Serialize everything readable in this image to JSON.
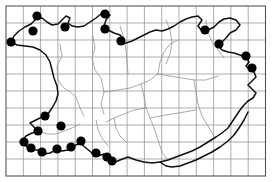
{
  "figure": {
    "kind": "species-distribution-map",
    "region_label": "England and Wales",
    "caption": "",
    "title": "",
    "background_color": "#ffffff",
    "outline_color": "#101010",
    "county_color": "#8d8d8d",
    "grid_color": "#8a8a8a",
    "dot_color": "#000000",
    "dot_radius": 4.6
  },
  "grid": {
    "visible": true,
    "columns": 15,
    "rows": 10,
    "cell_width": 17.3,
    "cell_height": 17.0,
    "x_start": 6,
    "y_start": 6,
    "x_end": 265.5,
    "y_end": 176
  },
  "legend": {
    "visible": false,
    "entries": [
      {
        "symbol": "filled-circle",
        "label": ""
      }
    ]
  },
  "axes": {
    "x_tick_labels": [],
    "y_tick_labels": [],
    "xlabel": "",
    "ylabel": ""
  },
  "chart_data": {
    "type": "scatter",
    "title": "",
    "xlabel": "",
    "ylabel": "",
    "grid": true,
    "legend_position": "none",
    "xlim": [
      6,
      265.5
    ],
    "ylim": [
      6,
      176
    ],
    "categories": [],
    "series": [
      {
        "name": "Records",
        "marker": "filled-circle",
        "color": "#000000",
        "count": 23,
        "points": [
          {
            "x": 37,
            "y": 16
          },
          {
            "x": 33,
            "y": 31
          },
          {
            "x": 11,
            "y": 42
          },
          {
            "x": 65,
            "y": 27
          },
          {
            "x": 105,
            "y": 14
          },
          {
            "x": 105,
            "y": 29
          },
          {
            "x": 121,
            "y": 41
          },
          {
            "x": 205,
            "y": 30
          },
          {
            "x": 219,
            "y": 44
          },
          {
            "x": 246,
            "y": 56
          },
          {
            "x": 252,
            "y": 68
          },
          {
            "x": 45,
            "y": 116
          },
          {
            "x": 61,
            "y": 126
          },
          {
            "x": 38,
            "y": 131
          },
          {
            "x": 24,
            "y": 142
          },
          {
            "x": 31,
            "y": 148
          },
          {
            "x": 42,
            "y": 152
          },
          {
            "x": 57,
            "y": 149
          },
          {
            "x": 71,
            "y": 147
          },
          {
            "x": 81,
            "y": 141
          },
          {
            "x": 96,
            "y": 153
          },
          {
            "x": 107,
            "y": 157
          },
          {
            "x": 112,
            "y": 161
          }
        ]
      }
    ]
  }
}
